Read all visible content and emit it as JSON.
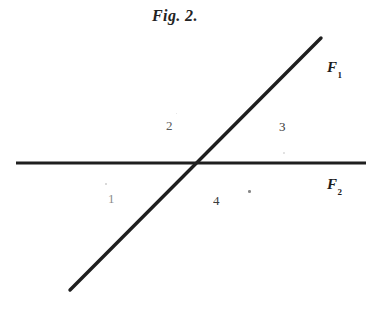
{
  "figure": {
    "caption": "Fig. 2.",
    "background_color": "#ffffff",
    "ink_color": "#1a1a1a",
    "width": 388,
    "height": 311
  },
  "lines": [
    {
      "id": "F1",
      "label": "F",
      "subscript": "1",
      "orientation": "diagonal",
      "x1": 70,
      "y1": 290,
      "x2": 321,
      "y2": 38,
      "stroke_width": 3.4,
      "color": "#1f1f1f"
    },
    {
      "id": "F2",
      "label": "F",
      "subscript": "2",
      "orientation": "horizontal",
      "x1": 16,
      "y1": 163,
      "x2": 366,
      "y2": 163,
      "stroke_width": 3.0,
      "color": "#1f1f1f"
    }
  ],
  "intersection": {
    "x": 199,
    "y": 163
  },
  "regions": [
    {
      "id": "region-1",
      "label": "1",
      "position": "lower-left",
      "x": 108,
      "y": 192
    },
    {
      "id": "region-2",
      "label": "2",
      "position": "upper-left",
      "x": 166,
      "y": 119
    },
    {
      "id": "region-3",
      "label": "3",
      "position": "upper-right",
      "x": 279,
      "y": 120
    },
    {
      "id": "region-4",
      "label": "4",
      "position": "lower-right",
      "x": 213,
      "y": 194
    }
  ],
  "labels": {
    "f1_display": "F",
    "f1_sub": "1",
    "f2_display": "F",
    "f2_sub": "2"
  },
  "artifacts": [
    {
      "x": 105,
      "y": 183,
      "size": 2.0,
      "opacity": 0.3
    },
    {
      "x": 248,
      "y": 190,
      "size": 2.6,
      "opacity": 0.7
    },
    {
      "x": 283,
      "y": 152,
      "size": 1.8,
      "opacity": 0.22
    },
    {
      "x": 176,
      "y": 113,
      "size": 1.4,
      "opacity": 0.18
    }
  ]
}
